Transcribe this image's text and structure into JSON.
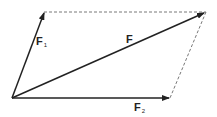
{
  "diagram": {
    "labels": {
      "f1_main": "F",
      "f1_sub": "1",
      "f_main": "F",
      "f2_main": "F",
      "f2_sub": "2"
    },
    "colors": {
      "stroke": "#222222",
      "dashed": "#555555"
    },
    "points": {
      "origin": [
        12,
        98
      ],
      "f1_tip": [
        44,
        12
      ],
      "f2_tip": [
        170,
        98
      ],
      "f_tip": [
        206,
        12
      ]
    }
  }
}
